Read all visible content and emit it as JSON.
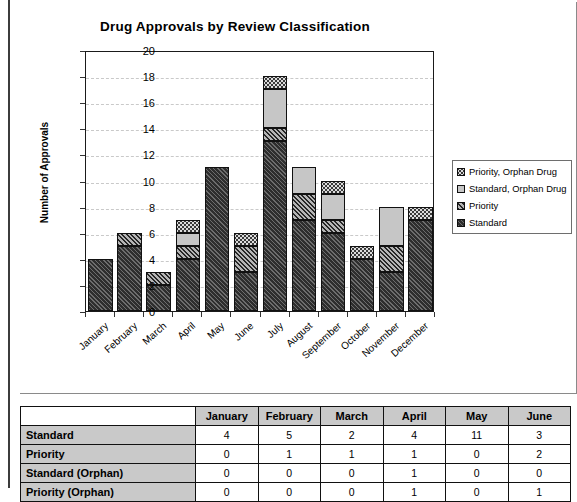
{
  "chart_data": {
    "type": "bar",
    "subtype": "stacked-bar",
    "title": "Drug Approvals by Review Classification",
    "xlabel": "",
    "ylabel": "Number of Approvals",
    "ylim": [
      0,
      20
    ],
    "ytick_step": 2,
    "yticks": [
      20,
      18,
      16,
      14,
      12,
      10,
      8,
      6,
      4,
      2,
      0
    ],
    "grid": "horizontal-dashed",
    "legend_position": "right",
    "categories": [
      "January",
      "February",
      "March",
      "April",
      "May",
      "June",
      "July",
      "August",
      "September",
      "October",
      "November",
      "December"
    ],
    "series": [
      {
        "name": "Standard",
        "values": [
          4,
          5,
          2,
          4,
          11,
          3,
          13,
          7,
          6,
          4,
          3,
          7
        ]
      },
      {
        "name": "Priority",
        "values": [
          0,
          1,
          1,
          1,
          0,
          2,
          1,
          2,
          1,
          0,
          2,
          0
        ]
      },
      {
        "name": "Standard, Orphan Drug",
        "values": [
          0,
          0,
          0,
          1,
          0,
          0,
          3,
          2,
          2,
          0,
          3,
          0
        ]
      },
      {
        "name": "Priority, Orphan Drug",
        "values": [
          0,
          0,
          0,
          1,
          0,
          1,
          1,
          0,
          1,
          1,
          0,
          1
        ]
      }
    ],
    "totals": [
      4,
      6,
      3,
      7,
      11,
      6,
      18,
      11,
      10,
      5,
      8,
      8
    ],
    "stack_order_bottom_to_top": [
      "Standard",
      "Priority",
      "Standard, Orphan Drug",
      "Priority, Orphan Drug"
    ],
    "series_styles": [
      {
        "name": "Priority, Orphan Drug",
        "swatch": "light-dotted",
        "color": "#dcdcdc"
      },
      {
        "name": "Standard, Orphan Drug",
        "swatch": "solid-light-gray",
        "color": "#c6c6c6"
      },
      {
        "name": "Priority",
        "swatch": "medium-gray-diagonal-hatch",
        "color": "#7d7d7d"
      },
      {
        "name": "Standard",
        "swatch": "dark-diagonal-hatch",
        "color": "#2e2e2e"
      }
    ],
    "legend_entries": [
      "Priority, Orphan Drug",
      "Standard, Orphan Drug",
      "Priority",
      "Standard"
    ]
  },
  "table": {
    "corner_label": "",
    "columns": [
      "January",
      "February",
      "March",
      "April",
      "May",
      "June"
    ],
    "rows": [
      {
        "label": "Standard",
        "values": [
          "4",
          "5",
          "2",
          "4",
          "11",
          "3"
        ]
      },
      {
        "label": "Priority",
        "values": [
          "0",
          "1",
          "1",
          "1",
          "0",
          "2"
        ]
      },
      {
        "label": "Standard (Orphan)",
        "values": [
          "0",
          "0",
          "0",
          "1",
          "0",
          "0"
        ]
      },
      {
        "label": "Priority (Orphan)",
        "values": [
          "0",
          "0",
          "0",
          "1",
          "0",
          "1"
        ]
      }
    ]
  }
}
